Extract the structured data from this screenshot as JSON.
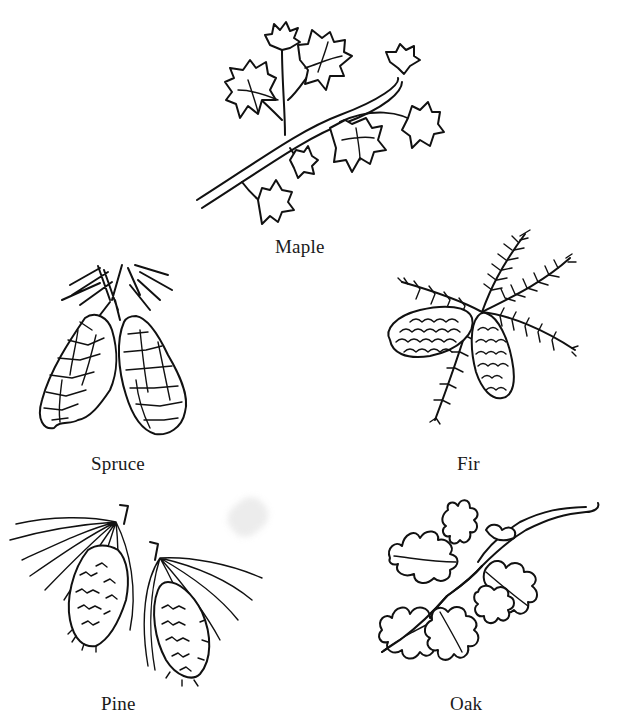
{
  "page": {
    "background": "#ffffff",
    "ink_color": "#111111"
  },
  "specimens": [
    {
      "id": "maple",
      "label": "Maple",
      "depicts": "maple branch with leaves"
    },
    {
      "id": "spruce",
      "label": "Spruce",
      "depicts": "two spruce cones with needles"
    },
    {
      "id": "fir",
      "label": "Fir",
      "depicts": "fir branch with two cones"
    },
    {
      "id": "pine",
      "label": "Pine",
      "depicts": "two pine cones with long needles"
    },
    {
      "id": "oak",
      "label": "Oak",
      "depicts": "oak twig with lobed leaves"
    }
  ]
}
